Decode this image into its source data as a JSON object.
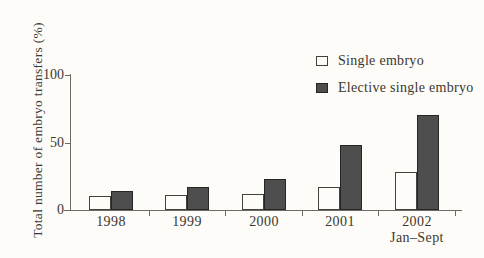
{
  "figure": {
    "background": "#fdfcf8",
    "text_color": "#3c372f",
    "axis_color": "#6e6a64"
  },
  "chart_data": {
    "type": "bar",
    "title": "",
    "ylabel": "Total number of embryo transfers (%)",
    "xlabel": "",
    "categories": [
      "1998",
      "1999",
      "2000",
      "2001",
      "2002"
    ],
    "category_sublabels": [
      "",
      "",
      "",
      "",
      "Jan–Sept"
    ],
    "yticks": [
      0,
      50,
      100
    ],
    "ylim": [
      0,
      100
    ],
    "grid": false,
    "legend_position": "upper-right",
    "series": [
      {
        "name": "Single embryo",
        "values": [
          10,
          11,
          12,
          17,
          28
        ],
        "fill": "#fdfcf8",
        "border": "#44403a",
        "swatch": "open"
      },
      {
        "name": "Elective single embryo",
        "values": [
          14,
          17,
          23,
          48,
          70
        ],
        "fill": "#4e4e4e",
        "border": "#262626",
        "swatch": "filled"
      }
    ]
  }
}
